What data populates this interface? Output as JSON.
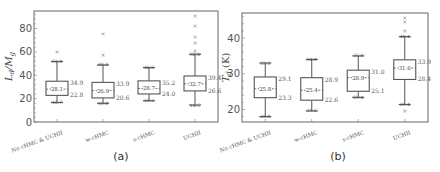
{
  "chart_data": [
    {
      "type": "box",
      "panel_label": "(a)",
      "ylabel": "L_d/M_g",
      "ylabel_display": "L₀/M₀",
      "xlabel": "",
      "ylim": [
        0,
        95
      ],
      "yticks": [
        0,
        20,
        40,
        60,
        80
      ],
      "categories": [
        "No cHMC & UCHII",
        "w-cHMC",
        "s-cHMC",
        "UCHII"
      ],
      "boxes": [
        {
          "category": "No cHMC & UCHII",
          "whisker_low": 16.7,
          "q1": 22.8,
          "median": 28.1,
          "q3": 34.9,
          "whisker_high": 51.8,
          "outliers": [
            60.0
          ]
        },
        {
          "category": "w-cHMC",
          "whisker_low": 16.0,
          "q1": 20.6,
          "median": 26.9,
          "q3": 33.9,
          "whisker_high": 48.8,
          "outliers": [
            57.0,
            75.0
          ]
        },
        {
          "category": "s-cHMC",
          "whisker_low": 18.2,
          "q1": 24.0,
          "median": 28.7,
          "q3": 35.2,
          "whisker_high": 46.6,
          "outliers": []
        },
        {
          "category": "UCHII",
          "whisker_low": 14.5,
          "q1": 26.6,
          "median": 32.7,
          "q3": 39.4,
          "whisker_high": 58.0,
          "outliers": [
            60.5,
            68.0,
            73.0,
            82.0,
            91.0
          ]
        }
      ]
    },
    {
      "type": "box",
      "panel_label": "(b)",
      "ylabel": "T_d (K)",
      "ylabel_display": "T₀ (K)",
      "xlabel": "",
      "ylim": [
        16.5,
        47
      ],
      "yticks": [
        20,
        30,
        40
      ],
      "categories": [
        "No cHMC & UCHII",
        "w-cHMC",
        "s-cHMC",
        "UCHII"
      ],
      "boxes": [
        {
          "category": "No cHMC & UCHII",
          "whisker_low": 18.0,
          "q1": 23.3,
          "median": 25.8,
          "q3": 29.1,
          "whisker_high": 33.0,
          "outliers": []
        },
        {
          "category": "w-cHMC",
          "whisker_low": 19.6,
          "q1": 22.6,
          "median": 25.4,
          "q3": 28.9,
          "whisker_high": 34.0,
          "outliers": []
        },
        {
          "category": "s-cHMC",
          "whisker_low": 23.4,
          "q1": 25.1,
          "median": 28.9,
          "q3": 31.0,
          "whisker_high": 35.0,
          "outliers": []
        },
        {
          "category": "UCHII",
          "whisker_low": 21.4,
          "q1": 28.4,
          "median": 31.6,
          "q3": 33.9,
          "whisker_high": 40.4,
          "outliers": [
            19.6,
            42.0,
            44.5,
            45.5
          ]
        }
      ]
    }
  ]
}
